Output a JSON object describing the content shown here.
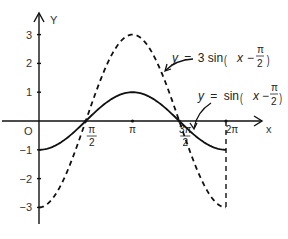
{
  "chart_data": {
    "type": "line",
    "title": "",
    "xlabel": "x",
    "ylabel": "Y",
    "origin_label": "O",
    "xlim": [
      0,
      6.2832
    ],
    "ylim": [
      -3,
      3
    ],
    "grid": false,
    "x_ticks": [
      {
        "value": 1.5708,
        "label_num": "π",
        "label_den": "2"
      },
      {
        "value": 3.1416,
        "label_num": "π",
        "label_den": ""
      },
      {
        "value": 4.7124,
        "label_num": "3π",
        "label_den": "2"
      },
      {
        "value": 6.2832,
        "label_num": "2π",
        "label_den": ""
      }
    ],
    "y_ticks": [
      {
        "value": 3,
        "label": "3"
      },
      {
        "value": 2,
        "label": "2"
      },
      {
        "value": 1,
        "label": "1"
      },
      {
        "value": -1,
        "label": "−1"
      },
      {
        "value": -2,
        "label": "−2"
      },
      {
        "value": -3,
        "label": "−3"
      }
    ],
    "series": [
      {
        "name": "y = sin(x − π/2)",
        "style": "solid",
        "amplitude": 1,
        "x": [
          0,
          0.7854,
          1.5708,
          2.3562,
          3.1416,
          3.927,
          4.7124,
          5.4978,
          6.2832
        ],
        "values": [
          -1,
          -0.707,
          0,
          0.707,
          1,
          0.707,
          0,
          -0.707,
          -1
        ]
      },
      {
        "name": "y = 3 sin(x − π/2)",
        "style": "dashed",
        "amplitude": 3,
        "x": [
          0,
          0.7854,
          1.5708,
          2.3562,
          3.1416,
          3.927,
          4.7124,
          5.4978,
          6.2832
        ],
        "values": [
          -3,
          -2.121,
          0,
          2.121,
          3,
          2.121,
          0,
          -2.121,
          -3
        ]
      }
    ],
    "annotations": [
      {
        "target": "y = 3 sin(x − π/2)",
        "lhs": "y",
        "eq": "=",
        "coef": "3 sin",
        "arg_var": "x",
        "arg_op": "−",
        "frac_num": "π",
        "frac_den": "2"
      },
      {
        "target": "y = sin(x − π/2)",
        "lhs": "y",
        "eq": "=",
        "coef": "sin",
        "arg_var": "x",
        "arg_op": "−",
        "frac_num": "π",
        "frac_den": "2"
      }
    ],
    "legend": "none (inline annotations with arrows)"
  }
}
